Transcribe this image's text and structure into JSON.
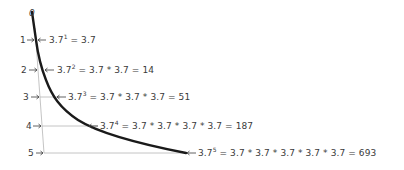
{
  "diagram": {
    "origin_label": "0",
    "base": "3.7",
    "rows": [
      {
        "index": "1",
        "exponent": "1",
        "expansion": "3.7",
        "result": "3.7",
        "text": "= 3.7"
      },
      {
        "index": "2",
        "exponent": "2",
        "expansion": "3.7 * 3.7",
        "result": "14",
        "text": "= 3.7 * 3.7 = 14"
      },
      {
        "index": "3",
        "exponent": "3",
        "expansion": "3.7 * 3.7 * 3.7",
        "result": "51",
        "text": "= 3.7 * 3.7 * 3.7 = 51"
      },
      {
        "index": "4",
        "exponent": "4",
        "expansion": "3.7 * 3.7 * 3.7 * 3.7",
        "result": "187",
        "text": "= 3.7 * 3.7 * 3.7 * 3.7 = 187"
      },
      {
        "index": "5",
        "exponent": "5",
        "expansion": "3.7 * 3.7 * 3.7 * 3.7 * 3.7",
        "result": "693",
        "text": "= 3.7 * 3.7 * 3.7 * 3.7 * 3.7 = 693"
      }
    ],
    "colors": {
      "curve": "#1a1a1a",
      "guide_lines": "#b0b0b0",
      "text": "#3a3a3a",
      "background": "#ffffff"
    }
  }
}
